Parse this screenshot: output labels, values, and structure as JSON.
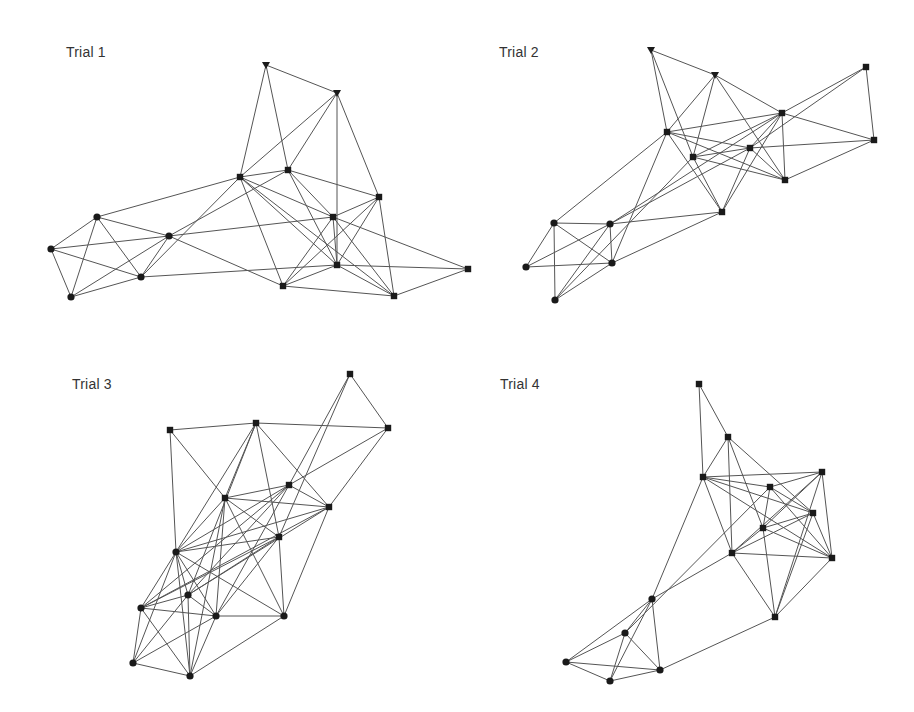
{
  "figure": {
    "width": 914,
    "height": 712,
    "edge_color": "#555555",
    "node_color": "#1a1a1a",
    "background": "#ffffff",
    "legend_shapes": {
      "triangle": "downward triangle node",
      "square": "square node",
      "circle": "circle node"
    }
  },
  "panels": [
    {
      "id": "trial-1",
      "title": "Trial 1",
      "title_pos": [
        66,
        44
      ],
      "nodes": [
        {
          "id": "a",
          "shape": "triangle",
          "x": 266,
          "y": 65
        },
        {
          "id": "b",
          "shape": "triangle",
          "x": 337,
          "y": 93
        },
        {
          "id": "c",
          "shape": "square",
          "x": 240,
          "y": 177
        },
        {
          "id": "d",
          "shape": "square",
          "x": 288,
          "y": 170
        },
        {
          "id": "e",
          "shape": "square",
          "x": 379,
          "y": 197
        },
        {
          "id": "f",
          "shape": "square",
          "x": 333,
          "y": 217
        },
        {
          "id": "g",
          "shape": "square",
          "x": 337,
          "y": 265
        },
        {
          "id": "h",
          "shape": "square",
          "x": 283,
          "y": 286
        },
        {
          "id": "i",
          "shape": "square",
          "x": 394,
          "y": 296
        },
        {
          "id": "j",
          "shape": "square",
          "x": 468,
          "y": 269
        },
        {
          "id": "k",
          "shape": "circle",
          "x": 97,
          "y": 217
        },
        {
          "id": "l",
          "shape": "circle",
          "x": 51,
          "y": 249
        },
        {
          "id": "m",
          "shape": "circle",
          "x": 169,
          "y": 236
        },
        {
          "id": "n",
          "shape": "circle",
          "x": 141,
          "y": 277
        },
        {
          "id": "o",
          "shape": "circle",
          "x": 71,
          "y": 297
        }
      ],
      "edges": [
        [
          "a",
          "b"
        ],
        [
          "a",
          "c"
        ],
        [
          "a",
          "d"
        ],
        [
          "b",
          "c"
        ],
        [
          "b",
          "d"
        ],
        [
          "b",
          "g"
        ],
        [
          "b",
          "e"
        ],
        [
          "c",
          "d"
        ],
        [
          "c",
          "k"
        ],
        [
          "c",
          "n"
        ],
        [
          "c",
          "f"
        ],
        [
          "c",
          "g"
        ],
        [
          "c",
          "h"
        ],
        [
          "c",
          "i"
        ],
        [
          "d",
          "m"
        ],
        [
          "d",
          "e"
        ],
        [
          "d",
          "f"
        ],
        [
          "d",
          "g"
        ],
        [
          "e",
          "f"
        ],
        [
          "e",
          "g"
        ],
        [
          "e",
          "h"
        ],
        [
          "e",
          "i"
        ],
        [
          "f",
          "g"
        ],
        [
          "f",
          "h"
        ],
        [
          "f",
          "m"
        ],
        [
          "f",
          "j"
        ],
        [
          "f",
          "i"
        ],
        [
          "g",
          "h"
        ],
        [
          "g",
          "n"
        ],
        [
          "g",
          "i"
        ],
        [
          "g",
          "j"
        ],
        [
          "h",
          "m"
        ],
        [
          "h",
          "i"
        ],
        [
          "i",
          "j"
        ],
        [
          "k",
          "l"
        ],
        [
          "k",
          "m"
        ],
        [
          "k",
          "n"
        ],
        [
          "k",
          "o"
        ],
        [
          "l",
          "m"
        ],
        [
          "l",
          "n"
        ],
        [
          "l",
          "o"
        ],
        [
          "m",
          "n"
        ],
        [
          "m",
          "o"
        ],
        [
          "n",
          "o"
        ]
      ]
    },
    {
      "id": "trial-2",
      "title": "Trial 2",
      "title_pos": [
        499,
        44
      ],
      "nodes": [
        {
          "id": "a",
          "shape": "triangle",
          "x": 651,
          "y": 50
        },
        {
          "id": "b",
          "shape": "triangle",
          "x": 715,
          "y": 75
        },
        {
          "id": "c",
          "shape": "square",
          "x": 667,
          "y": 132
        },
        {
          "id": "d",
          "shape": "square",
          "x": 693,
          "y": 157
        },
        {
          "id": "e",
          "shape": "square",
          "x": 750,
          "y": 148
        },
        {
          "id": "f",
          "shape": "square",
          "x": 782,
          "y": 113
        },
        {
          "id": "g",
          "shape": "square",
          "x": 866,
          "y": 67
        },
        {
          "id": "h",
          "shape": "square",
          "x": 874,
          "y": 140
        },
        {
          "id": "i",
          "shape": "square",
          "x": 785,
          "y": 180
        },
        {
          "id": "j",
          "shape": "square",
          "x": 722,
          "y": 212
        },
        {
          "id": "k",
          "shape": "circle",
          "x": 554,
          "y": 223
        },
        {
          "id": "l",
          "shape": "circle",
          "x": 610,
          "y": 224
        },
        {
          "id": "m",
          "shape": "circle",
          "x": 526,
          "y": 267
        },
        {
          "id": "n",
          "shape": "circle",
          "x": 612,
          "y": 263
        },
        {
          "id": "o",
          "shape": "circle",
          "x": 555,
          "y": 300
        }
      ],
      "edges": [
        [
          "a",
          "b"
        ],
        [
          "a",
          "c"
        ],
        [
          "a",
          "d"
        ],
        [
          "b",
          "c"
        ],
        [
          "b",
          "d"
        ],
        [
          "b",
          "f"
        ],
        [
          "b",
          "i"
        ],
        [
          "c",
          "f"
        ],
        [
          "c",
          "e"
        ],
        [
          "c",
          "i"
        ],
        [
          "c",
          "j"
        ],
        [
          "c",
          "k"
        ],
        [
          "c",
          "n"
        ],
        [
          "d",
          "e"
        ],
        [
          "d",
          "f"
        ],
        [
          "d",
          "i"
        ],
        [
          "d",
          "j"
        ],
        [
          "d",
          "o"
        ],
        [
          "e",
          "f"
        ],
        [
          "e",
          "h"
        ],
        [
          "e",
          "i"
        ],
        [
          "e",
          "j"
        ],
        [
          "e",
          "l"
        ],
        [
          "f",
          "g"
        ],
        [
          "f",
          "h"
        ],
        [
          "f",
          "i"
        ],
        [
          "f",
          "j"
        ],
        [
          "f",
          "l"
        ],
        [
          "g",
          "h"
        ],
        [
          "g",
          "e"
        ],
        [
          "h",
          "i"
        ],
        [
          "j",
          "l"
        ],
        [
          "j",
          "n"
        ],
        [
          "k",
          "l"
        ],
        [
          "k",
          "m"
        ],
        [
          "k",
          "n"
        ],
        [
          "k",
          "o"
        ],
        [
          "l",
          "m"
        ],
        [
          "l",
          "n"
        ],
        [
          "l",
          "o"
        ],
        [
          "m",
          "n"
        ],
        [
          "n",
          "o"
        ]
      ]
    },
    {
      "id": "trial-3",
      "title": "Trial 3",
      "title_pos": [
        72,
        376
      ],
      "nodes": [
        {
          "id": "a",
          "shape": "square",
          "x": 350,
          "y": 374
        },
        {
          "id": "b",
          "shape": "square",
          "x": 170,
          "y": 430
        },
        {
          "id": "c",
          "shape": "square",
          "x": 256,
          "y": 423
        },
        {
          "id": "d",
          "shape": "square",
          "x": 388,
          "y": 428
        },
        {
          "id": "e",
          "shape": "square",
          "x": 289,
          "y": 485
        },
        {
          "id": "f",
          "shape": "square",
          "x": 225,
          "y": 498
        },
        {
          "id": "g",
          "shape": "square",
          "x": 329,
          "y": 507
        },
        {
          "id": "h",
          "shape": "square",
          "x": 279,
          "y": 537
        },
        {
          "id": "i",
          "shape": "circle",
          "x": 176,
          "y": 552
        },
        {
          "id": "j",
          "shape": "circle",
          "x": 188,
          "y": 595
        },
        {
          "id": "k",
          "shape": "circle",
          "x": 141,
          "y": 608
        },
        {
          "id": "l",
          "shape": "circle",
          "x": 216,
          "y": 616
        },
        {
          "id": "m",
          "shape": "circle",
          "x": 284,
          "y": 616
        },
        {
          "id": "n",
          "shape": "circle",
          "x": 133,
          "y": 663
        },
        {
          "id": "o",
          "shape": "circle",
          "x": 190,
          "y": 676
        }
      ],
      "edges": [
        [
          "a",
          "d"
        ],
        [
          "a",
          "e"
        ],
        [
          "a",
          "h"
        ],
        [
          "b",
          "c"
        ],
        [
          "b",
          "f"
        ],
        [
          "b",
          "i"
        ],
        [
          "c",
          "d"
        ],
        [
          "c",
          "i"
        ],
        [
          "c",
          "f"
        ],
        [
          "c",
          "h"
        ],
        [
          "c",
          "g"
        ],
        [
          "c",
          "j"
        ],
        [
          "d",
          "e"
        ],
        [
          "d",
          "g"
        ],
        [
          "e",
          "f"
        ],
        [
          "e",
          "g"
        ],
        [
          "e",
          "i"
        ],
        [
          "e",
          "j"
        ],
        [
          "e",
          "l"
        ],
        [
          "e",
          "k"
        ],
        [
          "f",
          "g"
        ],
        [
          "f",
          "h"
        ],
        [
          "f",
          "i"
        ],
        [
          "f",
          "l"
        ],
        [
          "f",
          "m"
        ],
        [
          "f",
          "o"
        ],
        [
          "g",
          "i"
        ],
        [
          "g",
          "j"
        ],
        [
          "g",
          "k"
        ],
        [
          "g",
          "m"
        ],
        [
          "h",
          "i"
        ],
        [
          "h",
          "j"
        ],
        [
          "h",
          "l"
        ],
        [
          "h",
          "k"
        ],
        [
          "h",
          "m"
        ],
        [
          "i",
          "j"
        ],
        [
          "i",
          "k"
        ],
        [
          "i",
          "l"
        ],
        [
          "i",
          "m"
        ],
        [
          "i",
          "n"
        ],
        [
          "i",
          "o"
        ],
        [
          "j",
          "k"
        ],
        [
          "j",
          "l"
        ],
        [
          "j",
          "n"
        ],
        [
          "j",
          "o"
        ],
        [
          "k",
          "l"
        ],
        [
          "k",
          "n"
        ],
        [
          "k",
          "o"
        ],
        [
          "l",
          "m"
        ],
        [
          "l",
          "n"
        ],
        [
          "l",
          "o"
        ],
        [
          "m",
          "o"
        ],
        [
          "n",
          "o"
        ]
      ]
    },
    {
      "id": "trial-4",
      "title": "Trial 4",
      "title_pos": [
        500,
        376
      ],
      "nodes": [
        {
          "id": "a",
          "shape": "square",
          "x": 699,
          "y": 384
        },
        {
          "id": "b",
          "shape": "square",
          "x": 728,
          "y": 437
        },
        {
          "id": "c",
          "shape": "square",
          "x": 703,
          "y": 477
        },
        {
          "id": "d",
          "shape": "square",
          "x": 822,
          "y": 472
        },
        {
          "id": "e",
          "shape": "square",
          "x": 770,
          "y": 487
        },
        {
          "id": "f",
          "shape": "square",
          "x": 813,
          "y": 513
        },
        {
          "id": "g",
          "shape": "square",
          "x": 763,
          "y": 528
        },
        {
          "id": "h",
          "shape": "square",
          "x": 732,
          "y": 553
        },
        {
          "id": "i",
          "shape": "square",
          "x": 832,
          "y": 558
        },
        {
          "id": "j",
          "shape": "square",
          "x": 775,
          "y": 617
        },
        {
          "id": "k",
          "shape": "circle",
          "x": 652,
          "y": 599
        },
        {
          "id": "l",
          "shape": "circle",
          "x": 625,
          "y": 633
        },
        {
          "id": "m",
          "shape": "circle",
          "x": 566,
          "y": 662
        },
        {
          "id": "n",
          "shape": "circle",
          "x": 610,
          "y": 681
        },
        {
          "id": "o",
          "shape": "circle",
          "x": 660,
          "y": 670
        }
      ],
      "edges": [
        [
          "a",
          "b"
        ],
        [
          "a",
          "c"
        ],
        [
          "b",
          "c"
        ],
        [
          "b",
          "h"
        ],
        [
          "b",
          "g"
        ],
        [
          "b",
          "f"
        ],
        [
          "c",
          "d"
        ],
        [
          "c",
          "e"
        ],
        [
          "c",
          "f"
        ],
        [
          "c",
          "h"
        ],
        [
          "c",
          "k"
        ],
        [
          "c",
          "i"
        ],
        [
          "d",
          "e"
        ],
        [
          "d",
          "g"
        ],
        [
          "d",
          "h"
        ],
        [
          "d",
          "i"
        ],
        [
          "d",
          "j"
        ],
        [
          "e",
          "f"
        ],
        [
          "e",
          "g"
        ],
        [
          "e",
          "i"
        ],
        [
          "e",
          "l"
        ],
        [
          "f",
          "g"
        ],
        [
          "f",
          "h"
        ],
        [
          "f",
          "j"
        ],
        [
          "f",
          "i"
        ],
        [
          "g",
          "i"
        ],
        [
          "g",
          "j"
        ],
        [
          "g",
          "h"
        ],
        [
          "h",
          "i"
        ],
        [
          "h",
          "j"
        ],
        [
          "h",
          "k"
        ],
        [
          "i",
          "j"
        ],
        [
          "j",
          "o"
        ],
        [
          "k",
          "l"
        ],
        [
          "k",
          "m"
        ],
        [
          "k",
          "n"
        ],
        [
          "k",
          "o"
        ],
        [
          "l",
          "m"
        ],
        [
          "l",
          "n"
        ],
        [
          "l",
          "o"
        ],
        [
          "m",
          "n"
        ],
        [
          "m",
          "o"
        ],
        [
          "n",
          "o"
        ]
      ]
    }
  ]
}
